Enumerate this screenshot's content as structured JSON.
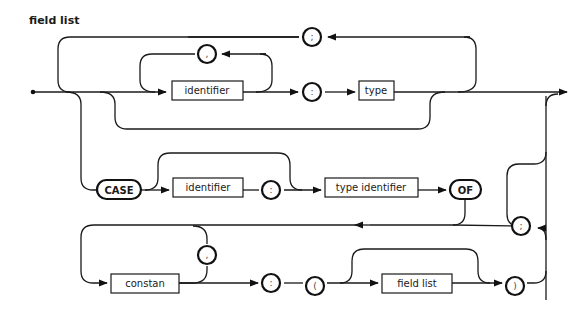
{
  "diagram": {
    "title": "field list",
    "nonterminals": {
      "identifier_1": "identifier",
      "type": "type",
      "identifier_2": "identifier",
      "type_identifier": "type identifier",
      "constant": "constan",
      "field_list": "field list"
    },
    "keywords": {
      "case": "CASE",
      "of": "OF"
    },
    "symbols": {
      "semicolon_top": ";",
      "comma_ident": ",",
      "colon_type": ":",
      "colon_case": ":",
      "semicolon_variant": ";",
      "comma_const": ",",
      "colon_variant": ":",
      "lparen": "(",
      "rparen": ")"
    }
  }
}
